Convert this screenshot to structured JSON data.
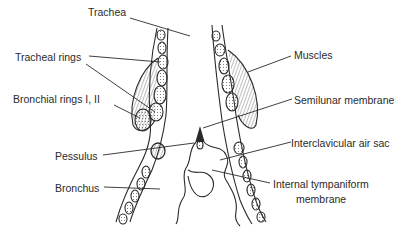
{
  "diagram": {
    "labels": {
      "trachea": "Trachea",
      "tracheal_rings": "Tracheal rings",
      "bronchial_rings": "Bronchial rings I, II",
      "pessulus": "Pessulus",
      "bronchus": "Bronchus",
      "muscles": "Muscles",
      "semilunar_membrane": "Semilunar membrane",
      "interclavicular_air_sac": "Interclavicular air sac",
      "internal_tympaniform_line1": "Internal tympaniform",
      "internal_tympaniform_line2": "membrane"
    },
    "colors": {
      "ink": "#2a2a2a",
      "background": "#ffffff"
    }
  }
}
